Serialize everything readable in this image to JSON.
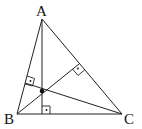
{
  "diagram": {
    "vertices": [
      {
        "id": "A",
        "label": "A"
      },
      {
        "id": "B",
        "label": "B"
      },
      {
        "id": "C",
        "label": "C"
      }
    ],
    "altitudes": [
      {
        "from": "A",
        "to_side": "BC"
      },
      {
        "from": "B",
        "to_side": "AC"
      },
      {
        "from": "C",
        "to_side": "AB"
      }
    ],
    "right_angle_markers": 3,
    "intersection_point": "orthocenter",
    "colors": {
      "stroke": "#222222",
      "background": "#ffffff"
    }
  }
}
